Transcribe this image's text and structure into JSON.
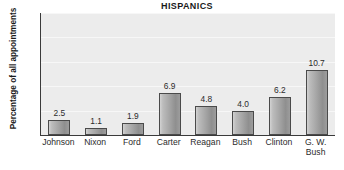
{
  "chart_data": {
    "type": "bar",
    "title": "HISPANICS",
    "xlabel": "",
    "ylabel": "Percentage of all appointments",
    "categories": [
      "Johnson",
      "Nixon",
      "Ford",
      "Carter",
      "Reagan",
      "Bush",
      "Clinton",
      "G. W. Bush"
    ],
    "category_lines": [
      [
        "Johnson"
      ],
      [
        "Nixon"
      ],
      [
        "Ford"
      ],
      [
        "Carter"
      ],
      [
        "Reagan"
      ],
      [
        "Bush"
      ],
      [
        "Clinton"
      ],
      [
        "G. W.",
        "Bush"
      ]
    ],
    "values": [
      2.5,
      1.1,
      1.9,
      6.9,
      4.8,
      4.0,
      6.2,
      10.7
    ],
    "value_labels": [
      "2.5",
      "1.1",
      "1.9",
      "6.9",
      "4.8",
      "4.0",
      "6.2",
      "10.7"
    ],
    "ylim": [
      0,
      20
    ],
    "yticks": [
      4,
      8,
      12,
      16,
      20
    ],
    "ytick_labels": [
      "4",
      "8",
      "12",
      "16",
      "20"
    ],
    "grid": true,
    "legend": false,
    "colors": {
      "plot_background": "#ececec",
      "gridline": "#f7f7f7",
      "axis": "#3a3a3a",
      "bar_light": "#d2d2d2",
      "bar_dark": "#8f8f8f",
      "bar_outline": "#4a4a4a",
      "text": "#2b2b2b",
      "title_text": "#1a1a1a",
      "page_background": "#ffffff"
    }
  }
}
